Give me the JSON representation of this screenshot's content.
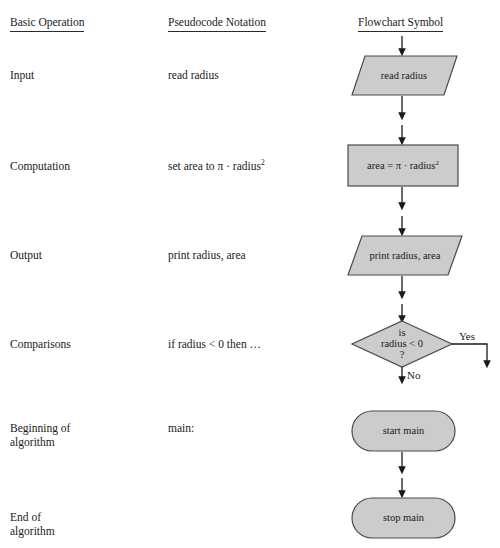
{
  "headers": {
    "basic_operation": "Basic Operation",
    "pseudocode_notation": "Pseudocode Notation",
    "flowchart_symbol": "Flowchart Symbol"
  },
  "rows": [
    {
      "operation": "Input",
      "pseudocode": "read radius",
      "symbol_type": "parallelogram",
      "symbol_text": "read radius"
    },
    {
      "operation": "Computation",
      "pseudocode_prefix": "set area to π · radius",
      "pseudocode_sup": "2",
      "symbol_type": "rectangle",
      "symbol_text_prefix": "area = π · radius",
      "symbol_text_sup": "2"
    },
    {
      "operation": "Output",
      "pseudocode": "print radius, area",
      "symbol_type": "parallelogram",
      "symbol_text": "print radius, area"
    },
    {
      "operation": "Comparisons",
      "pseudocode": "if radius < 0 then …",
      "symbol_type": "diamond",
      "symbol_line1": "is",
      "symbol_line2": "radius < 0",
      "symbol_line3": "?",
      "branch_yes": "Yes",
      "branch_no": "No"
    },
    {
      "operation": "Beginning of\nalgorithm",
      "pseudocode": "main:",
      "symbol_type": "stadium",
      "symbol_text": "start main"
    },
    {
      "operation": "End of\nalgorithm",
      "pseudocode": "",
      "symbol_type": "stadium",
      "symbol_text": "stop main"
    }
  ],
  "colors": {
    "shape_fill": "#cccccc",
    "shape_stroke": "#4a4a4a",
    "connector": "#1a1a1a",
    "text": "#1a1a1a",
    "background": "#ffffff"
  }
}
